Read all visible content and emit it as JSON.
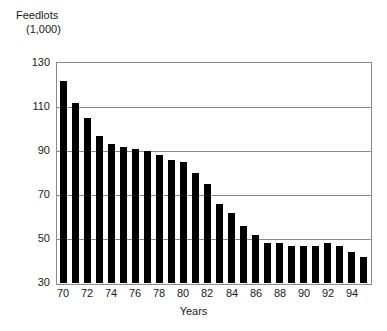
{
  "chart_data": {
    "type": "bar",
    "title": "Feedlots (1,000)",
    "title_line1": "Feedlots",
    "title_line2": "(1,000)",
    "xlabel": "Years",
    "ylabel": "Feedlots (1,000)",
    "ylim": [
      30,
      130
    ],
    "ytick_labels": [
      "130",
      "110",
      "90",
      "70",
      "50",
      "30"
    ],
    "ytick_values": [
      130,
      110,
      90,
      70,
      50,
      30
    ],
    "grid": true,
    "legend": null,
    "bar_color": "#000000",
    "frame_color": "#8a8a8a",
    "categories": [
      "70",
      "71",
      "72",
      "73",
      "74",
      "75",
      "76",
      "77",
      "78",
      "79",
      "80",
      "81",
      "82",
      "83",
      "84",
      "85",
      "86",
      "87",
      "88",
      "89",
      "90",
      "91",
      "92",
      "93",
      "94",
      "95"
    ],
    "xtick_labels": [
      "70",
      "72",
      "74",
      "76",
      "78",
      "80",
      "82",
      "84",
      "86",
      "88",
      "90",
      "92",
      "94"
    ],
    "values": [
      122,
      112,
      105,
      97,
      93,
      92,
      91,
      90,
      88,
      86,
      85,
      80,
      75,
      66,
      62,
      56,
      52,
      48,
      48,
      47,
      47,
      47,
      48,
      47,
      44,
      42
    ],
    "series": [
      {
        "name": "Feedlots",
        "values": [
          122,
          112,
          105,
          97,
          93,
          92,
          91,
          90,
          88,
          86,
          85,
          80,
          75,
          66,
          62,
          56,
          52,
          48,
          48,
          47,
          47,
          47,
          48,
          47,
          44,
          42
        ]
      }
    ]
  }
}
